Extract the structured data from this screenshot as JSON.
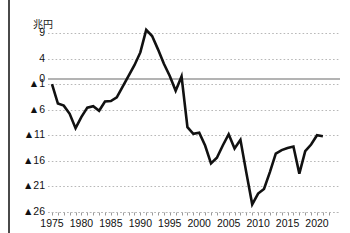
{
  "chart_data": {
    "type": "line",
    "title": "",
    "unit_label": "兆円",
    "xlabel": "",
    "ylabel": "",
    "grid": true,
    "legend": "none",
    "xlim": [
      1975,
      2022
    ],
    "ylim": [
      -26,
      11
    ],
    "y_ticks": [
      9,
      4,
      0,
      -1,
      -6,
      -11,
      -16,
      -21,
      -26
    ],
    "y_tick_labels": [
      "9",
      "4",
      "0",
      "▲1",
      "▲6",
      "▲11",
      "▲16",
      "▲21",
      "▲26"
    ],
    "x_ticks": [
      1975,
      1980,
      1985,
      1990,
      1995,
      2000,
      2005,
      2010,
      2015,
      2020
    ],
    "x_tick_labels": [
      "1975",
      "1980",
      "1985",
      "1990",
      "1995",
      "2000",
      "2005",
      "2010",
      "2015",
      "2020"
    ],
    "zero_line": 0,
    "series": [
      {
        "name": "balance",
        "color": "#111111",
        "x": [
          1975,
          1976,
          1977,
          1978,
          1979,
          1980,
          1981,
          1982,
          1983,
          1984,
          1985,
          1986,
          1987,
          1988,
          1989,
          1990,
          1991,
          1992,
          1993,
          1994,
          1995,
          1996,
          1997,
          1998,
          1999,
          2000,
          2001,
          2002,
          2003,
          2004,
          2005,
          2006,
          2007,
          2008,
          2009,
          2010,
          2011,
          2012,
          2013,
          2014,
          2015,
          2016,
          2017,
          2018,
          2019,
          2020,
          2021
        ],
        "values": [
          -1.0,
          -4.8,
          -5.2,
          -6.8,
          -9.6,
          -7.4,
          -5.6,
          -5.3,
          -6.2,
          -4.4,
          -4.3,
          -3.6,
          -1.5,
          0.6,
          2.7,
          5.2,
          9.6,
          8.4,
          5.8,
          3.0,
          0.6,
          -2.3,
          0.5,
          -9.4,
          -10.7,
          -10.5,
          -13.0,
          -16.5,
          -15.4,
          -13.0,
          -10.8,
          -13.6,
          -11.9,
          -18.3,
          -24.5,
          -22.4,
          -21.5,
          -18.2,
          -14.6,
          -13.9,
          -13.5,
          -13.2,
          -18.5,
          -14.1,
          -12.8,
          -11.0,
          -11.2
        ]
      }
    ]
  },
  "axis": {
    "left_rule": "vertical-rule"
  },
  "watermark": {
    "text": ""
  }
}
